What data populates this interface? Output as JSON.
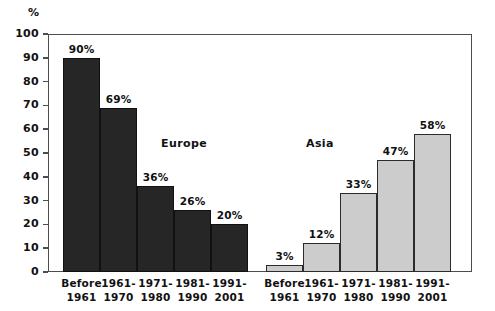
{
  "chart_data": {
    "type": "bar",
    "title": "",
    "subtitle": "",
    "xlabel": "",
    "ylabel": "%",
    "ylim": [
      0,
      100
    ],
    "yticks": [
      0,
      10,
      20,
      30,
      40,
      50,
      60,
      70,
      80,
      90,
      100
    ],
    "ytick_labels": [
      "0",
      "10",
      "20",
      "30",
      "40",
      "50",
      "60",
      "70",
      "80",
      "90",
      "100"
    ],
    "grid": false,
    "legend": "none",
    "categories": [
      "Before 1961",
      "1961-1970",
      "1971-1980",
      "1981-1990",
      "1991-2001"
    ],
    "category_lines": [
      [
        "Before",
        "1961"
      ],
      [
        "1961-",
        "1970"
      ],
      [
        "1971-",
        "1980"
      ],
      [
        "1981-",
        "1990"
      ],
      [
        "1991-",
        "2001"
      ]
    ],
    "series": [
      {
        "name": "Europe",
        "color": "#262626",
        "values": [
          90,
          69,
          36,
          26,
          20
        ],
        "value_labels": [
          "90%",
          "69%",
          "36%",
          "26%",
          "20%"
        ]
      },
      {
        "name": "Asia",
        "color": "#cccccc",
        "values": [
          3,
          12,
          33,
          47,
          58
        ],
        "value_labels": [
          "3%",
          "12%",
          "33%",
          "47%",
          "58%"
        ]
      }
    ],
    "annotations": [
      {
        "text": "Europe",
        "x_px": 161,
        "y_px": 137
      },
      {
        "text": "Asia",
        "x_px": 306,
        "y_px": 137
      }
    ],
    "colors": {
      "europe_fill": "#262626",
      "asia_fill": "#cccccc",
      "bar_border": "#111111",
      "axis": "#4d4d4d",
      "background": "#ffffff",
      "text": "#111111"
    }
  }
}
